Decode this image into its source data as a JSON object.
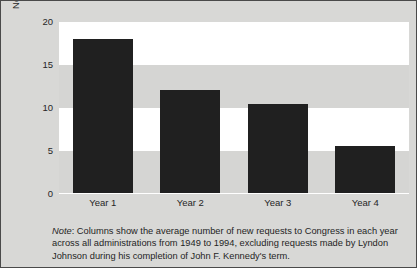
{
  "chart_data": {
    "type": "bar",
    "title": "",
    "xlabel": "",
    "ylabel": "New Requests to Congress",
    "categories": [
      "Year 1",
      "Year 2",
      "Year 3",
      "Year 4"
    ],
    "values": [
      18.0,
      12.1,
      10.5,
      5.6
    ],
    "ylim": [
      0,
      20
    ],
    "yticks": [
      0,
      5,
      10,
      15,
      20
    ],
    "ytick_labels": [
      "0",
      "5",
      "10",
      "15",
      "20"
    ],
    "grid": false,
    "banded_background": true,
    "legend": null,
    "bar_color": "#202020",
    "plot_background": "#ffffff",
    "band_color": "#d5d5d3",
    "figure_background": "#d8d8d6",
    "note": {
      "label": "Note",
      "separator": ": ",
      "text": "Columns show the average number of new requests to Congress in each year across all administrations from 1949 to 1994, excluding requests made by Lyndon Johnson during his completion of John F. Kennedy's term."
    }
  }
}
